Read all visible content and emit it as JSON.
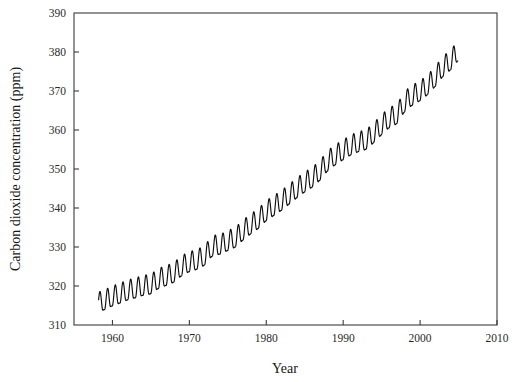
{
  "figure": {
    "background_color": "#ffffff",
    "frame_color": "#3b3b3b",
    "curve_color": "#0d0d0d"
  },
  "chart_data": {
    "type": "line",
    "title": "",
    "subtitle": "",
    "xlabel": "Year",
    "ylabel": "Carbon dioxide concentration (ppm)",
    "xlim": [
      1955,
      2010
    ],
    "ylim": [
      310,
      390
    ],
    "xticks": [
      1960,
      1970,
      1980,
      1990,
      2000,
      2010
    ],
    "xtick_labels": [
      "1960",
      "1970",
      "1980",
      "1990",
      "2000",
      "2010"
    ],
    "yticks": [
      310,
      320,
      330,
      340,
      350,
      360,
      370,
      380,
      390
    ],
    "ytick_labels": [
      "310",
      "320",
      "330",
      "340",
      "350",
      "360",
      "370",
      "380",
      "390"
    ],
    "grid": false,
    "legend": null,
    "annotations": [],
    "series": [
      {
        "name": "Atmospheric CO2 concentration",
        "description": "Monthly mean CO2 with annual seasonal cycle superimposed on rising trend",
        "x_start": 1958.2,
        "x_end": 2004.9,
        "seasonal_amplitude_ppm": 3.1,
        "seasonal_peak_month_fraction": 0.37,
        "annual_mean": [
          {
            "year": 1958,
            "value": 315.3
          },
          {
            "year": 1959,
            "value": 315.98
          },
          {
            "year": 1960,
            "value": 316.91
          },
          {
            "year": 1961,
            "value": 317.64
          },
          {
            "year": 1962,
            "value": 318.45
          },
          {
            "year": 1963,
            "value": 318.99
          },
          {
            "year": 1964,
            "value": 319.62
          },
          {
            "year": 1965,
            "value": 320.04
          },
          {
            "year": 1966,
            "value": 321.38
          },
          {
            "year": 1967,
            "value": 322.16
          },
          {
            "year": 1968,
            "value": 323.04
          },
          {
            "year": 1969,
            "value": 324.62
          },
          {
            "year": 1970,
            "value": 325.68
          },
          {
            "year": 1971,
            "value": 326.32
          },
          {
            "year": 1972,
            "value": 327.45
          },
          {
            "year": 1973,
            "value": 329.68
          },
          {
            "year": 1974,
            "value": 330.18
          },
          {
            "year": 1975,
            "value": 331.11
          },
          {
            "year": 1976,
            "value": 332.04
          },
          {
            "year": 1977,
            "value": 333.83
          },
          {
            "year": 1978,
            "value": 335.4
          },
          {
            "year": 1979,
            "value": 336.84
          },
          {
            "year": 1980,
            "value": 338.75
          },
          {
            "year": 1981,
            "value": 340.11
          },
          {
            "year": 1982,
            "value": 341.45
          },
          {
            "year": 1983,
            "value": 343.05
          },
          {
            "year": 1984,
            "value": 344.65
          },
          {
            "year": 1985,
            "value": 346.12
          },
          {
            "year": 1986,
            "value": 347.42
          },
          {
            "year": 1987,
            "value": 349.19
          },
          {
            "year": 1988,
            "value": 351.57
          },
          {
            "year": 1989,
            "value": 353.12
          },
          {
            "year": 1990,
            "value": 354.39
          },
          {
            "year": 1991,
            "value": 355.61
          },
          {
            "year": 1992,
            "value": 356.45
          },
          {
            "year": 1993,
            "value": 357.1
          },
          {
            "year": 1994,
            "value": 358.83
          },
          {
            "year": 1995,
            "value": 360.82
          },
          {
            "year": 1996,
            "value": 362.61
          },
          {
            "year": 1997,
            "value": 363.73
          },
          {
            "year": 1998,
            "value": 366.7
          },
          {
            "year": 1999,
            "value": 368.38
          },
          {
            "year": 2000,
            "value": 369.55
          },
          {
            "year": 2001,
            "value": 371.14
          },
          {
            "year": 2002,
            "value": 373.28
          },
          {
            "year": 2003,
            "value": 375.8
          },
          {
            "year": 2004,
            "value": 377.52
          },
          {
            "year": 2005,
            "value": 379.8
          }
        ]
      }
    ]
  }
}
